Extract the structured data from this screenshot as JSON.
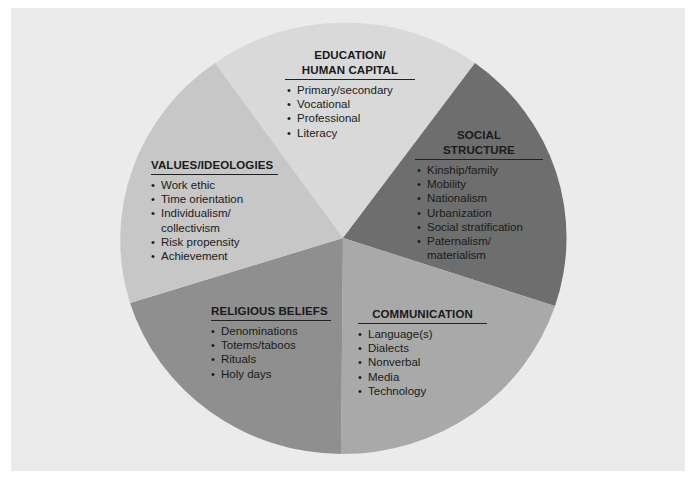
{
  "colors": {
    "background": "#ebebeb",
    "education": "#d9d9d9",
    "social_structure": "#6e6e6e",
    "communication": "#a9a9a9",
    "religious_beliefs": "#8f8f8f",
    "values_ideologies": "#c7c7c7",
    "text": "#1a1a1a"
  },
  "wedges": [
    {
      "id": "education",
      "title_lines": [
        "EDUCATION/",
        "HUMAN CAPITAL"
      ],
      "items": [
        "Primary/secondary",
        "Vocational",
        "Professional",
        "Literacy"
      ]
    },
    {
      "id": "social_structure",
      "title_lines": [
        "SOCIAL",
        "STRUCTURE"
      ],
      "items": [
        "Kinship/family",
        "Mobility",
        "Nationalism",
        "Urbanization",
        "Social stratification",
        "Paternalism/",
        "materialism"
      ]
    },
    {
      "id": "communication",
      "title_lines": [
        "COMMUNICATION"
      ],
      "items": [
        "Language(s)",
        "Dialects",
        "Nonverbal",
        "Media",
        "Technology"
      ]
    },
    {
      "id": "religious_beliefs",
      "title_lines": [
        "RELIGIOUS BELIEFS"
      ],
      "items": [
        "Denominations",
        "Totems/taboos",
        "Rituals",
        "Holy days"
      ]
    },
    {
      "id": "values_ideologies",
      "title_lines": [
        "VALUES/IDEOLOGIES"
      ],
      "items": [
        "Work ethic",
        "Time orientation",
        "Individualism/",
        "collectivism",
        "Risk propensity",
        "Achievement"
      ]
    }
  ]
}
